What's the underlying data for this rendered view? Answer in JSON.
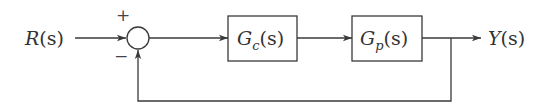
{
  "diagram": {
    "type": "feedback-control-block-diagram",
    "input": {
      "name": "R",
      "arg": "(s)"
    },
    "output": {
      "name": "Y",
      "arg": "(s)"
    },
    "summing_junction": {
      "plus_sign": "+",
      "minus_sign": "−"
    },
    "blocks": [
      {
        "id": "controller",
        "name": "G",
        "subscript": "c",
        "arg": "(s)"
      },
      {
        "id": "plant",
        "name": "G",
        "subscript": "p",
        "arg": "(s)"
      }
    ],
    "feedback": "unity negative feedback",
    "colors": {
      "line": "#3a3a3a",
      "text": "#333333",
      "background": "#ffffff"
    }
  }
}
